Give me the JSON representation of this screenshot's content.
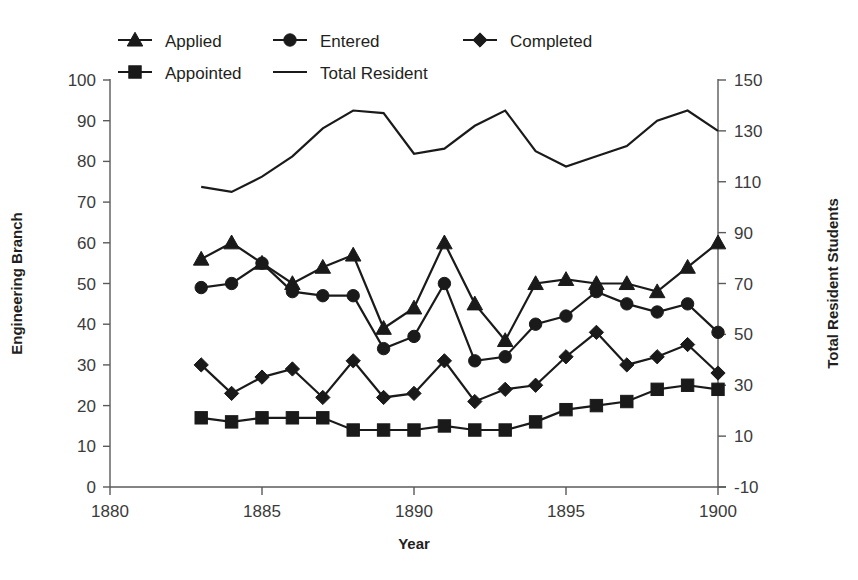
{
  "chart_data": {
    "type": "line",
    "title": "",
    "xlabel": "Year",
    "ylabel": "Engineering Branch",
    "y2label": "Total Resident Students",
    "x": [
      1883,
      1884,
      1885,
      1886,
      1887,
      1888,
      1889,
      1890,
      1891,
      1892,
      1893,
      1894,
      1895,
      1896,
      1897,
      1898,
      1899,
      1900
    ],
    "xlim": [
      1880,
      1900
    ],
    "ylim": [
      0,
      100
    ],
    "y2lim": [
      -10,
      150
    ],
    "xticks": [
      "1880",
      "1885",
      "1890",
      "1895",
      "1900"
    ],
    "yticks": [
      "0",
      "10",
      "20",
      "30",
      "40",
      "50",
      "60",
      "70",
      "80",
      "90",
      "100"
    ],
    "y2ticks": [
      "-10",
      "10",
      "30",
      "50",
      "70",
      "90",
      "110",
      "130",
      "150"
    ],
    "grid": false,
    "legend_position": "top",
    "series": [
      {
        "name": "Applied",
        "marker": "triangle",
        "axis": "left",
        "values": [
          56,
          60,
          55,
          50,
          54,
          57,
          39,
          44,
          60,
          45,
          36,
          50,
          51,
          50,
          50,
          48,
          54,
          60
        ]
      },
      {
        "name": "Entered",
        "marker": "circle",
        "axis": "left",
        "values": [
          49,
          50,
          55,
          48,
          47,
          47,
          34,
          37,
          50,
          31,
          32,
          40,
          42,
          48,
          45,
          43,
          45,
          38
        ]
      },
      {
        "name": "Completed",
        "marker": "diamond",
        "axis": "left",
        "values": [
          30,
          23,
          27,
          29,
          22,
          31,
          22,
          23,
          31,
          21,
          24,
          25,
          32,
          38,
          30,
          32,
          35,
          28
        ]
      },
      {
        "name": "Appointed",
        "marker": "square",
        "axis": "left",
        "values": [
          17,
          16,
          17,
          17,
          17,
          14,
          14,
          14,
          15,
          14,
          14,
          16,
          19,
          20,
          21,
          24,
          25,
          24
        ]
      },
      {
        "name": "Total Resident",
        "marker": "none",
        "axis": "right",
        "values": [
          108,
          106,
          112,
          120,
          131,
          138,
          137,
          121,
          123,
          132,
          138,
          122,
          116,
          120,
          124,
          134,
          138,
          130
        ]
      }
    ]
  },
  "legend": {
    "items": [
      {
        "label": "Applied",
        "marker": "triangle"
      },
      {
        "label": "Entered",
        "marker": "circle"
      },
      {
        "label": "Completed",
        "marker": "diamond"
      },
      {
        "label": "Appointed",
        "marker": "square"
      },
      {
        "label": "Total Resident",
        "marker": "line"
      }
    ]
  },
  "colors": {
    "ink": "#1a1a1a",
    "axis": "#5a5a5a",
    "text": "#231f20",
    "background": "#ffffff"
  }
}
